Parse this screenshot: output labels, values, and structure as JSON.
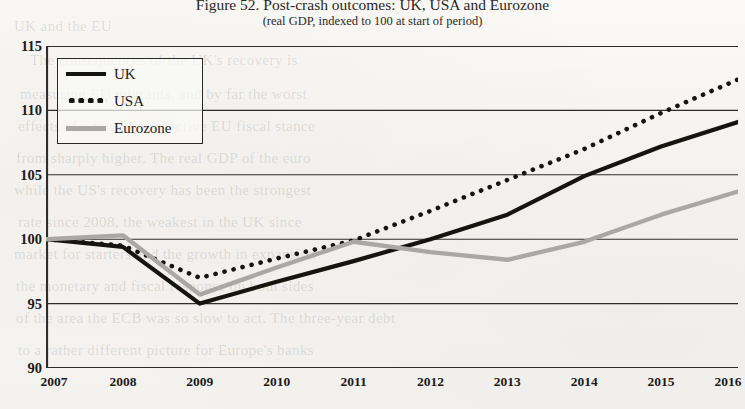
{
  "figure": {
    "title": "Figure 52. Post-crash outcomes: UK, USA and Eurozone",
    "subtitle": "(real GDP, indexed to 100 at start of period)"
  },
  "legend": {
    "position": "top-left",
    "items": [
      {
        "label": "UK",
        "style": "solid",
        "color": "#16140f"
      },
      {
        "label": "USA",
        "style": "dotted",
        "color": "#16140f"
      },
      {
        "label": "Eurozone",
        "style": "solid",
        "color": "#a9a8a4"
      }
    ]
  },
  "axes": {
    "y_ticks": [
      "115",
      "110",
      "105",
      "100",
      "95",
      "90"
    ],
    "x_ticks": [
      "2007",
      "2008",
      "2009",
      "2010",
      "2011",
      "2012",
      "2013",
      "2014",
      "2015",
      "2016"
    ]
  },
  "bleed_text": [
    {
      "text": "UK and the EU",
      "x": 14,
      "y": 18,
      "size": 15
    },
    {
      "text": "The consequences of the UK's recovery is",
      "x": 30,
      "y": 52,
      "size": 15
    },
    {
      "text": "measuring EU migrants, and by far the worst",
      "x": 20,
      "y": 86,
      "size": 15
    },
    {
      "text": "effects of a much more active EU fiscal stance",
      "x": 18,
      "y": 118,
      "size": 15
    },
    {
      "text": "from sharply higher. The real GDP of the euro",
      "x": 16,
      "y": 150,
      "size": 15
    },
    {
      "text": "while the US's recovery has been the strongest",
      "x": 14,
      "y": 182,
      "size": 15
    },
    {
      "text": "rate since 2008, the weakest in the UK since",
      "x": 18,
      "y": 214,
      "size": 15
    },
    {
      "text": "market for starters and the growth in expansion",
      "x": 14,
      "y": 246,
      "size": 15
    },
    {
      "text": "the monetary and fiscal response on both sides",
      "x": 16,
      "y": 278,
      "size": 15
    },
    {
      "text": "of the area the ECB was so slow to act. The three-year debt",
      "x": 16,
      "y": 310,
      "size": 15
    },
    {
      "text": "to a rather different picture for Europe's banks",
      "x": 18,
      "y": 342,
      "size": 15
    }
  ],
  "chart_data": {
    "type": "line",
    "title": "Figure 52. Post-crash outcomes: UK, USA and Eurozone",
    "subtitle": "(real GDP, indexed to 100 at start of period)",
    "xlabel": "",
    "ylabel": "",
    "x": [
      2007,
      2008,
      2009,
      2010,
      2011,
      2012,
      2013,
      2014,
      2015,
      2016
    ],
    "xlim": [
      2007,
      2016
    ],
    "ylim": [
      90,
      115
    ],
    "ytick_step": 5,
    "grid": true,
    "legend_position": "upper left",
    "series": [
      {
        "name": "UK",
        "style": "solid",
        "color": "#16140f",
        "values": [
          100.0,
          99.4,
          95.0,
          96.7,
          98.3,
          100.0,
          101.9,
          104.9,
          107.2,
          109.1
        ]
      },
      {
        "name": "USA",
        "style": "dotted",
        "color": "#16140f",
        "values": [
          100.0,
          99.5,
          97.0,
          98.5,
          99.9,
          102.2,
          104.6,
          107.0,
          109.8,
          112.4
        ]
      },
      {
        "name": "Eurozone",
        "style": "solid",
        "color": "#a9a8a4",
        "values": [
          100.0,
          100.3,
          95.7,
          97.8,
          99.8,
          99.0,
          98.4,
          99.8,
          101.9,
          103.7
        ]
      }
    ]
  }
}
